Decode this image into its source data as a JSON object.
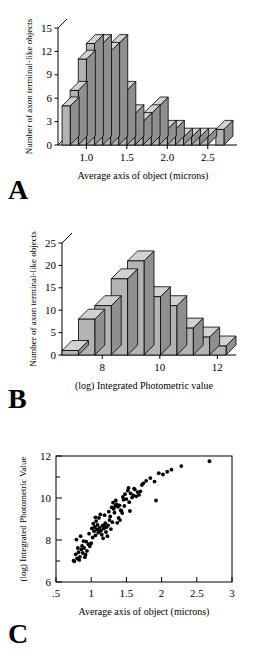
{
  "figure": {
    "panels": [
      {
        "letter": "A",
        "chart_index": 0
      },
      {
        "letter": "B",
        "chart_index": 1
      },
      {
        "letter": "C",
        "chart_index": 2
      }
    ]
  },
  "chart_data": [
    {
      "type": "bar",
      "panel": "A",
      "title": "",
      "xlabel": "Average  axis of object  (microns)",
      "ylabel": "Number of axon terminal-like objects",
      "xlim": [
        0.65,
        2.75
      ],
      "ylim": [
        0,
        15
      ],
      "xticks": [
        1.0,
        1.5,
        2.0,
        2.5
      ],
      "xticklabels": [
        "1.0",
        "1.5",
        "2.0",
        "2.5"
      ],
      "yticks": [
        0,
        3,
        6,
        9,
        12,
        15
      ],
      "yticklabels": [
        "0",
        "3",
        "6",
        "9",
        "12",
        "15"
      ],
      "grid": false,
      "legend": "none",
      "bin_width": 0.1,
      "bin_starts": [
        0.7,
        0.8,
        0.9,
        1.0,
        1.1,
        1.2,
        1.3,
        1.4,
        1.5,
        1.6,
        1.7,
        1.8,
        1.9,
        2.0,
        2.1,
        2.2,
        2.3,
        2.4,
        2.5,
        2.6
      ],
      "categories": [
        "0.7",
        "0.8",
        "0.9",
        "1.0",
        "1.1",
        "1.2",
        "1.3",
        "1.4",
        "1.5",
        "1.6",
        "1.7",
        "1.8",
        "1.9",
        "2.0",
        "2.1",
        "2.2",
        "2.3",
        "2.4",
        "2.5",
        "2.6"
      ],
      "values": [
        5,
        7,
        11,
        13,
        13,
        12,
        13,
        7,
        4,
        3,
        4,
        5,
        2,
        2,
        1,
        1,
        1,
        1,
        0,
        2
      ]
    },
    {
      "type": "bar",
      "panel": "B",
      "title": "",
      "xlabel": "(log) Integrated Photometric value",
      "ylabel": "Number of axon terminal-like objects",
      "xlim": [
        6.6,
        12.3
      ],
      "ylim": [
        0,
        25
      ],
      "xticks": [
        8,
        10,
        12
      ],
      "xticklabels": [
        "8",
        "10",
        "12"
      ],
      "yticks": [
        0,
        5,
        10,
        15,
        20,
        25
      ],
      "yticklabels": [
        "0",
        "5",
        "10",
        "15",
        "20",
        "25"
      ],
      "grid": false,
      "legend": "none",
      "bin_width": 0.57,
      "bin_starts": [
        6.6,
        7.17,
        7.74,
        8.31,
        8.88,
        9.45,
        10.02,
        10.59,
        11.16,
        11.73
      ],
      "categories": [
        "6.6",
        "7.2",
        "7.7",
        "8.3",
        "8.9",
        "9.5",
        "10.0",
        "10.6",
        "11.2",
        "11.7"
      ],
      "values": [
        1,
        8,
        11,
        17,
        21,
        13,
        11,
        6,
        4,
        2
      ]
    },
    {
      "type": "scatter",
      "panel": "C",
      "title": "",
      "xlabel": "Average axis of object  (microns)",
      "ylabel": "(log) Integrated Photometric Value",
      "xlim": [
        0.5,
        3.0
      ],
      "ylim": [
        6,
        12
      ],
      "xticks": [
        0.5,
        1.0,
        1.5,
        2.0,
        2.5,
        3.0
      ],
      "xticklabels": [
        ".5",
        "1",
        "1.5",
        "2",
        "2.5",
        "3"
      ],
      "yticks": [
        6,
        7,
        8,
        9,
        10,
        11,
        12
      ],
      "yticklabels": [
        "6",
        "",
        "8",
        "",
        "10",
        "",
        "12"
      ],
      "ytickmajor": [
        6,
        8,
        10,
        12
      ],
      "grid": false,
      "legend": "none",
      "marker": "filled-circle",
      "points": [
        [
          0.76,
          6.98
        ],
        [
          0.78,
          7.32
        ],
        [
          0.8,
          7.12
        ],
        [
          0.82,
          7.42
        ],
        [
          0.84,
          7.2
        ],
        [
          0.86,
          7.55
        ],
        [
          0.83,
          7.05
        ],
        [
          0.88,
          7.38
        ],
        [
          0.9,
          7.62
        ],
        [
          0.92,
          7.3
        ],
        [
          0.87,
          7.72
        ],
        [
          0.94,
          7.48
        ],
        [
          0.96,
          7.8
        ],
        [
          0.91,
          7.18
        ],
        [
          0.98,
          7.7
        ],
        [
          0.79,
          8.02
        ],
        [
          0.85,
          8.18
        ],
        [
          0.93,
          7.92
        ],
        [
          1.0,
          7.85
        ],
        [
          1.02,
          8.12
        ],
        [
          0.97,
          8.3
        ],
        [
          1.04,
          8.42
        ],
        [
          1.06,
          8.22
        ],
        [
          1.08,
          8.5
        ],
        [
          1.05,
          8.62
        ],
        [
          1.1,
          8.35
        ],
        [
          1.12,
          8.58
        ],
        [
          1.09,
          8.72
        ],
        [
          1.14,
          8.45
        ],
        [
          1.16,
          8.68
        ],
        [
          1.07,
          8.9
        ],
        [
          1.11,
          9.05
        ],
        [
          1.03,
          8.78
        ],
        [
          1.18,
          8.55
        ],
        [
          1.2,
          8.8
        ],
        [
          1.22,
          8.62
        ],
        [
          1.15,
          8.25
        ],
        [
          1.17,
          8.08
        ],
        [
          1.24,
          8.7
        ],
        [
          1.26,
          8.95
        ],
        [
          1.19,
          9.18
        ],
        [
          1.13,
          9.22
        ],
        [
          1.21,
          8.38
        ],
        [
          1.28,
          8.52
        ],
        [
          1.3,
          8.85
        ],
        [
          1.25,
          9.35
        ],
        [
          1.32,
          9.48
        ],
        [
          1.34,
          9.62
        ],
        [
          1.29,
          9.55
        ],
        [
          1.36,
          9.7
        ],
        [
          1.31,
          9.78
        ],
        [
          1.38,
          9.58
        ],
        [
          1.35,
          9.88
        ],
        [
          1.4,
          9.65
        ],
        [
          1.42,
          9.42
        ],
        [
          1.33,
          9.3
        ],
        [
          1.27,
          9.12
        ],
        [
          1.23,
          8.18
        ],
        [
          1.37,
          8.82
        ],
        [
          1.44,
          9.28
        ],
        [
          1.46,
          9.92
        ],
        [
          1.48,
          10.18
        ],
        [
          1.5,
          9.95
        ],
        [
          1.45,
          10.05
        ],
        [
          1.52,
          10.35
        ],
        [
          1.54,
          9.8
        ],
        [
          1.56,
          10.22
        ],
        [
          1.58,
          10.02
        ],
        [
          1.43,
          9.38
        ],
        [
          1.6,
          10.12
        ],
        [
          1.62,
          10.4
        ],
        [
          1.64,
          10.08
        ],
        [
          1.66,
          10.28
        ],
        [
          1.68,
          10.15
        ],
        [
          1.7,
          10.32
        ],
        [
          1.55,
          9.38
        ],
        [
          1.72,
          10.62
        ],
        [
          1.78,
          10.82
        ],
        [
          1.84,
          10.95
        ],
        [
          1.9,
          10.78
        ],
        [
          1.92,
          9.88
        ],
        [
          1.96,
          11.18
        ],
        [
          2.02,
          11.12
        ],
        [
          2.08,
          11.25
        ],
        [
          2.14,
          11.35
        ],
        [
          2.28,
          11.52
        ],
        [
          2.68,
          11.75
        ],
        [
          0.75,
          7.02
        ],
        [
          0.81,
          7.62
        ],
        [
          1.01,
          8.55
        ],
        [
          1.12,
          8.42
        ],
        [
          1.18,
          8.68
        ],
        [
          0.89,
          7.95
        ],
        [
          1.06,
          9.08
        ],
        [
          1.39,
          9.05
        ],
        [
          1.41,
          8.95
        ],
        [
          1.47,
          9.62
        ],
        [
          1.53,
          10.48
        ],
        [
          1.61,
          10.45
        ],
        [
          1.74,
          10.7
        ]
      ]
    }
  ]
}
